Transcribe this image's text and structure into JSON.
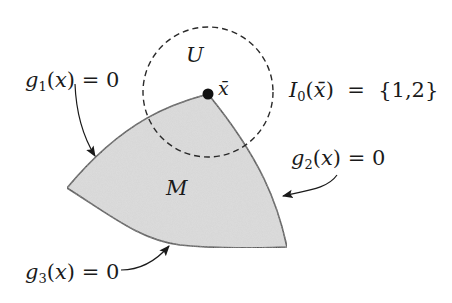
{
  "diagram": {
    "region": {
      "label": "M",
      "fill": "#d9d9d9",
      "stroke": "#333333"
    },
    "neighborhood": {
      "label": "U",
      "style": "dashed circle"
    },
    "point": {
      "label": "x̄"
    },
    "constraints": [
      {
        "id": "g1",
        "func": "g",
        "sub": "1",
        "arg": "x",
        "rhs": "0"
      },
      {
        "id": "g2",
        "func": "g",
        "sub": "2",
        "arg": "x",
        "rhs": "0"
      },
      {
        "id": "g3",
        "func": "g",
        "sub": "3",
        "arg": "x",
        "rhs": "0"
      }
    ],
    "active_set": {
      "symbol": "I",
      "sub": "0",
      "arg": "x̄",
      "equals": "=",
      "value": "{1,2}"
    }
  }
}
